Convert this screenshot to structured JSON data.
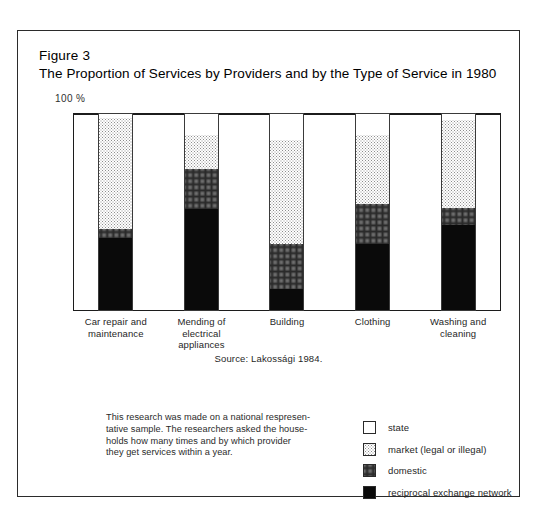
{
  "figure": {
    "number_label": "Figure 3",
    "title": "The Proportion of Services by Providers and by the Type of Service in 1980",
    "axis_max_label": "100 %",
    "source": "Source: Lakossági 1984."
  },
  "note": {
    "line1": "This research was made on a national respresen-",
    "line2": "tative sample. The researchers asked the house-",
    "line3": "holds how many times and by which provider",
    "line4": "they get services within a year."
  },
  "legend": {
    "items": [
      {
        "key": "state",
        "label": "state",
        "color": "#ffffff"
      },
      {
        "key": "market",
        "label": "market (legal or illegal)",
        "color": "#d0d0d0"
      },
      {
        "key": "domestic",
        "label": "domestic",
        "color": "#707070"
      },
      {
        "key": "reciprocal",
        "label": "reciprocal exchange network",
        "color": "#0a0a0a"
      }
    ]
  },
  "chart_data": {
    "type": "bar",
    "subtype": "stacked-100",
    "title": "The Proportion of Services by Providers and by the Type of Service in 1980",
    "xlabel": "",
    "ylabel": "",
    "ylim": [
      0,
      100
    ],
    "yticks": [
      100
    ],
    "ytick_labels": [
      "100 %"
    ],
    "grid": false,
    "gridline_at": 50,
    "legend_position": "bottom-right",
    "categories": [
      "Car repair and maintenance",
      "Mending of electrical appliances",
      "Building",
      "Clothing",
      "Washing and cleaning"
    ],
    "category_lines": [
      [
        "Car repair and",
        "maintenance"
      ],
      [
        "Mending of",
        "electrical",
        "appliances"
      ],
      [
        "Building"
      ],
      [
        "Clothing"
      ],
      [
        "Washing and",
        "cleaning"
      ]
    ],
    "series": [
      {
        "name": "reciprocal exchange network",
        "color": "#0a0a0a",
        "values": [
          37,
          51.5,
          11,
          34,
          43.5
        ]
      },
      {
        "name": "domestic",
        "color": "#707070",
        "values": [
          4.5,
          20,
          23,
          20,
          8.5
        ]
      },
      {
        "name": "market (legal or illegal)",
        "color": "#d0d0d0",
        "values": [
          56,
          17.5,
          52.5,
          35,
          44.5
        ]
      },
      {
        "name": "state",
        "color": "#ffffff",
        "values": [
          2.5,
          11,
          13.5,
          11,
          3.5
        ]
      }
    ],
    "source": "Source: Lakossági 1984."
  }
}
